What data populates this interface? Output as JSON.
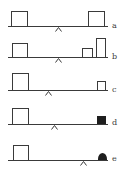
{
  "colors": {
    "line": "#3a3a3a",
    "fill": "#1e1e1e",
    "background": "#ffffff"
  },
  "panels": [
    {
      "label": "a",
      "beam_y": 26,
      "pivot_x": 58,
      "objects": [
        {
          "type": "open-box",
          "x": 11,
          "w": 17,
          "h": 15
        },
        {
          "type": "open-box",
          "x": 88,
          "w": 17,
          "h": 15
        }
      ]
    },
    {
      "label": "b",
      "beam_y": 57,
      "pivot_x": 58,
      "objects": [
        {
          "type": "open-box",
          "x": 12,
          "w": 16,
          "h": 14
        },
        {
          "type": "open-box",
          "x": 82,
          "w": 11,
          "h": 9
        },
        {
          "type": "open-box",
          "x": 96,
          "w": 10,
          "h": 19
        }
      ]
    },
    {
      "label": "c",
      "beam_y": 90,
      "pivot_x": 48,
      "objects": [
        {
          "type": "open-box",
          "x": 12,
          "w": 17,
          "h": 17
        },
        {
          "type": "open-box",
          "x": 97,
          "w": 9,
          "h": 9
        }
      ]
    },
    {
      "label": "d",
      "beam_y": 124,
      "pivot_x": 54,
      "objects": [
        {
          "type": "open-box",
          "x": 12,
          "w": 17,
          "h": 16
        },
        {
          "type": "filled-box",
          "x": 97,
          "w": 9,
          "h": 8
        }
      ]
    },
    {
      "label": "e",
      "beam_y": 160,
      "pivot_x": 83,
      "objects": [
        {
          "type": "open-box",
          "x": 13,
          "w": 16,
          "h": 15
        },
        {
          "type": "filled-dome",
          "x": 98,
          "w": 9,
          "h": 7
        }
      ]
    }
  ]
}
